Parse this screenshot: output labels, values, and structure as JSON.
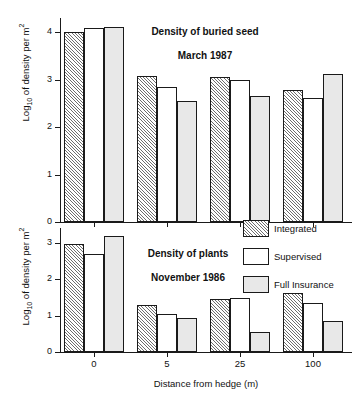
{
  "figure": {
    "ylabel_main": "Log",
    "ylabel_sub": "10",
    "ylabel_rest": " of density per m",
    "ylabel_sup": "2",
    "xlabel": "Distance from hedge (m)"
  },
  "legend": {
    "position": "top-right of lower panel",
    "items": [
      {
        "label": "Integrated",
        "pattern": "diagonal-hatch",
        "color": "#ffffff"
      },
      {
        "label": "Supervised",
        "pattern": "solid-white",
        "color": "#ffffff"
      },
      {
        "label": "Full Insurance",
        "pattern": "solid-gray",
        "color": "#e8e8e8"
      }
    ]
  },
  "chart_data": [
    {
      "id": "buried-seed",
      "type": "bar",
      "title": "Density of buried seed\nMarch 1987",
      "title_line1": "Density of buried seed",
      "title_line2": "March 1987",
      "xlabel": "",
      "ylabel": "Log10 of density per m2",
      "categories": [
        "0",
        "5",
        "25",
        "100"
      ],
      "ylim": [
        0,
        4.3
      ],
      "yticks": [
        0,
        1,
        2,
        3,
        4
      ],
      "grid": false,
      "series": [
        {
          "name": "Integrated",
          "values": [
            4.0,
            3.08,
            3.06,
            2.78
          ]
        },
        {
          "name": "Supervised",
          "values": [
            4.1,
            2.85,
            3.0,
            2.62
          ]
        },
        {
          "name": "Full Insurance",
          "values": [
            4.11,
            2.55,
            2.65,
            3.12
          ]
        }
      ]
    },
    {
      "id": "plants",
      "type": "bar",
      "title": "Density of plants\nNovember 1986",
      "title_line1": "Density of plants",
      "title_line2": "November 1986",
      "xlabel": "Distance from hedge (m)",
      "ylabel": "Log10 of density per m2",
      "categories": [
        "0",
        "5",
        "25",
        "100"
      ],
      "ylim": [
        0,
        3.4
      ],
      "yticks": [
        0,
        1,
        2,
        3
      ],
      "grid": false,
      "series": [
        {
          "name": "Integrated",
          "values": [
            2.96,
            1.28,
            1.44,
            1.61
          ]
        },
        {
          "name": "Supervised",
          "values": [
            2.68,
            1.04,
            1.49,
            1.34
          ]
        },
        {
          "name": "Full Insurance",
          "values": [
            3.19,
            0.93,
            0.56,
            0.85
          ]
        }
      ]
    }
  ]
}
